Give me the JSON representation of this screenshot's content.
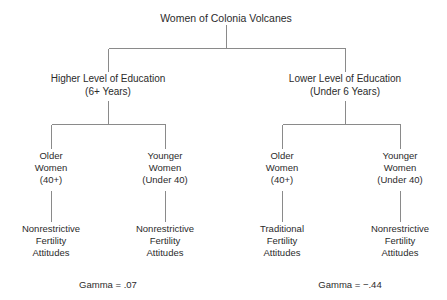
{
  "diagram": {
    "title": "Women of Colonia Volcanes",
    "root": {
      "label": "Women of Colonia Volcanes"
    },
    "education_levels": [
      {
        "name": "higher-education",
        "line1": "Higher Level of Education",
        "line2": "(6+ Years)"
      },
      {
        "name": "lower-education",
        "line1": "Lower Level of Education",
        "line2": "(Under 6 Years)"
      }
    ],
    "age_groups": [
      {
        "name": "older-women-higher-ed",
        "line1": "Older",
        "line2": "Women",
        "line3": "(40+)"
      },
      {
        "name": "younger-women-higher-ed",
        "line1": "Younger",
        "line2": "Women",
        "line3": "(Under 40)"
      },
      {
        "name": "older-women-lower-ed",
        "line1": "Older",
        "line2": "Women",
        "line3": "(40+)"
      },
      {
        "name": "younger-women-lower-ed",
        "line1": "Younger",
        "line2": "Women",
        "line3": "(Under 40)"
      }
    ],
    "outcomes": [
      {
        "name": "outcome-older-higher-ed",
        "line1": "Nonrestrictive",
        "line2": "Fertility",
        "line3": "Attitudes"
      },
      {
        "name": "outcome-younger-higher-ed",
        "line1": "Nonrestrictive",
        "line2": "Fertility",
        "line3": "Attitudes"
      },
      {
        "name": "outcome-older-lower-ed",
        "line1": "Traditional",
        "line2": "Fertility",
        "line3": "Attitudes"
      },
      {
        "name": "outcome-younger-lower-ed",
        "line1": "Nonrestrictive",
        "line2": "Fertility",
        "line3": "Attitudes"
      }
    ],
    "statistics": [
      {
        "name": "gamma-higher-education",
        "label": "Gamma = .07",
        "value": 0.07
      },
      {
        "name": "gamma-lower-education",
        "label": "Gamma = −.44",
        "value": -0.44
      }
    ],
    "colors": {
      "line": "#8a8a8a",
      "text": "#2b2b2b",
      "background": "#ffffff"
    }
  }
}
